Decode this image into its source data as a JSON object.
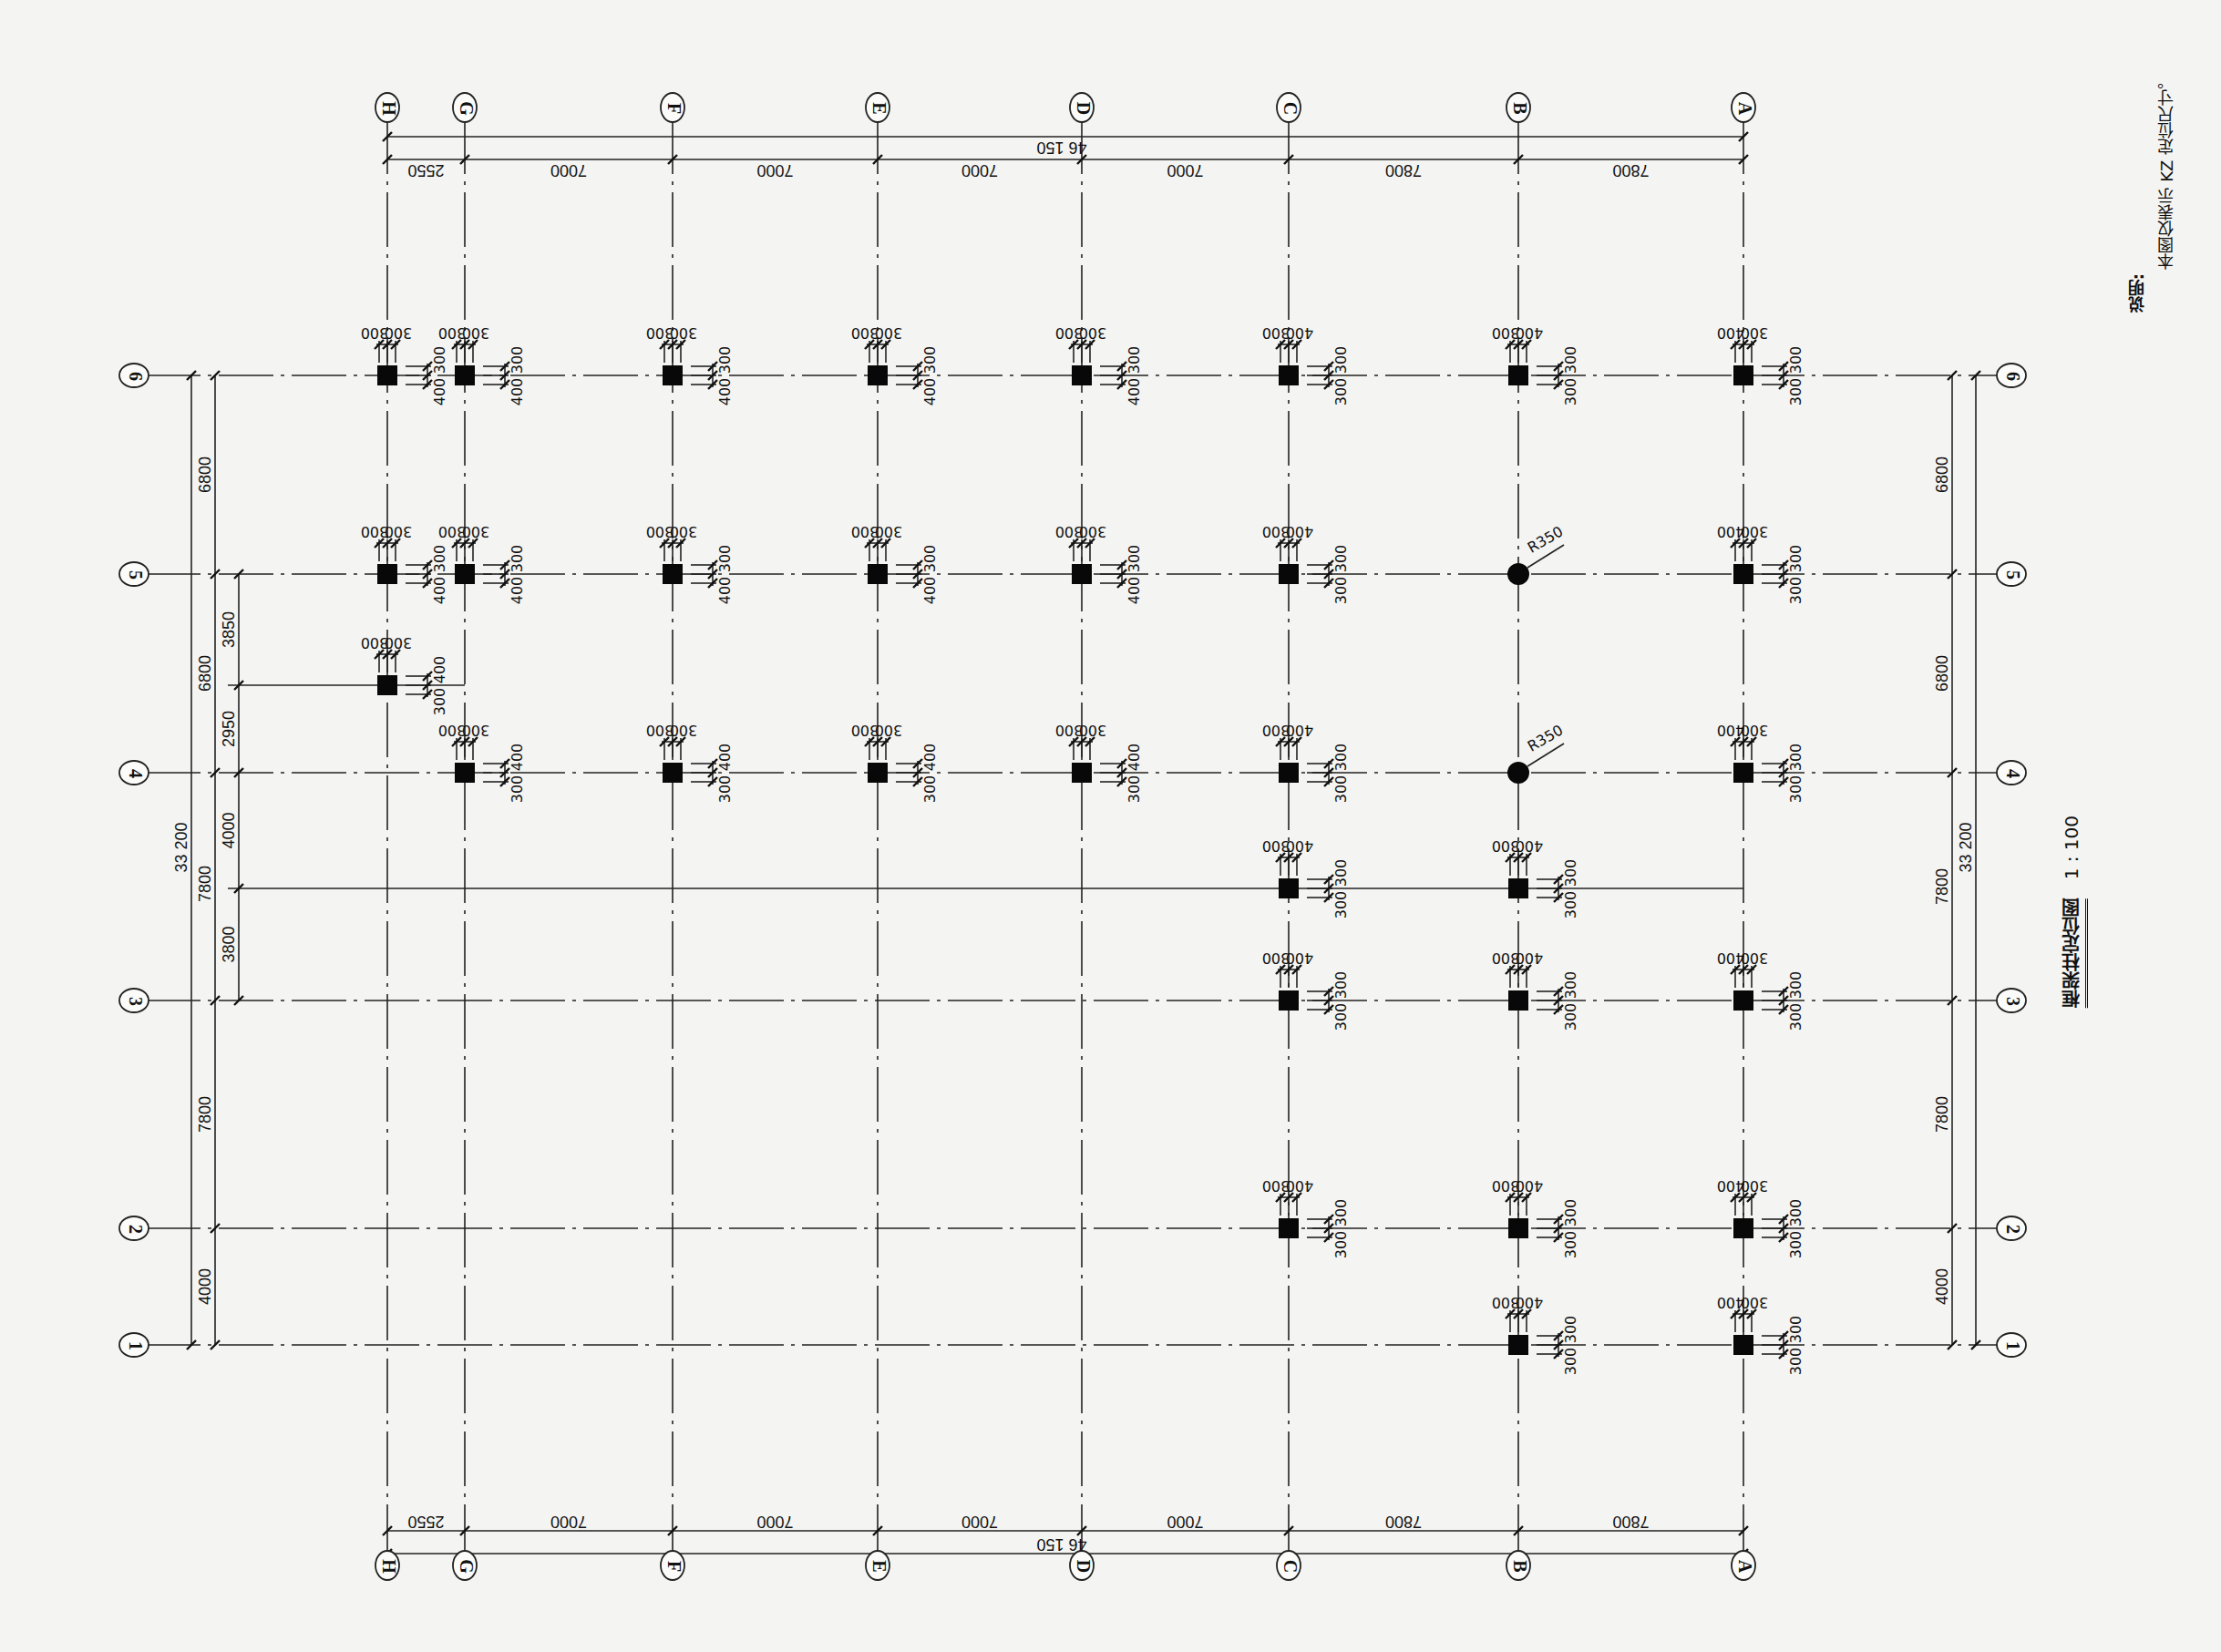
{
  "drawing": {
    "title": "框架柱定位图",
    "scale": "1 : 100",
    "note_heading": "说明:",
    "note_text": "本图仅表示 KZ 定位尺寸。"
  },
  "axes_letter": [
    {
      "label": "H",
      "x": 425
    },
    {
      "label": "G",
      "x": 510
    },
    {
      "label": "F",
      "x": 738
    },
    {
      "label": "E",
      "x": 963
    },
    {
      "label": "D",
      "x": 1187
    },
    {
      "label": "C",
      "x": 1414
    },
    {
      "label": "B",
      "x": 1666
    },
    {
      "label": "A",
      "x": 1913
    }
  ],
  "axes_number": [
    {
      "label": "6",
      "y": 412
    },
    {
      "label": "5",
      "y": 630
    },
    {
      "label": "4",
      "y": 848
    },
    {
      "label": "3",
      "y": 1098
    },
    {
      "label": "2",
      "y": 1348
    },
    {
      "label": "1",
      "y": 1476
    }
  ],
  "extra_lines": [
    {
      "y": 752,
      "x1": 250,
      "x2": 510,
      "note": "between 5 and 4"
    },
    {
      "y": 975,
      "x1": 250,
      "x2": 1913,
      "note": "between 4 and 3"
    }
  ],
  "dims_letter": {
    "segments": [
      "2550",
      "7000",
      "7000",
      "7000",
      "7000",
      "7800",
      "7800"
    ],
    "total": "46 150"
  },
  "dims_number_left": {
    "outer_total": "33 200",
    "middle": [
      "6800",
      "6800",
      "7800",
      "7800",
      "4000"
    ],
    "inner": [
      "3850",
      "2950",
      "4000",
      "3800"
    ]
  },
  "dims_number_right": {
    "outer_total": "33 200",
    "segments": [
      "6800",
      "6800",
      "7800",
      "7800",
      "4000"
    ]
  },
  "columns": [
    {
      "axis": "H6",
      "x": 425,
      "y": 412,
      "shape": "square",
      "top": [
        "300",
        "300"
      ],
      "side": [
        "300",
        "400"
      ]
    },
    {
      "axis": "G6",
      "x": 510,
      "y": 412,
      "shape": "square",
      "top": [
        "300",
        "300"
      ],
      "side": [
        "300",
        "400"
      ]
    },
    {
      "axis": "F6",
      "x": 738,
      "y": 412,
      "shape": "square",
      "top": [
        "300",
        "300"
      ],
      "side": [
        "300",
        "400"
      ]
    },
    {
      "axis": "E6",
      "x": 963,
      "y": 412,
      "shape": "square",
      "top": [
        "300",
        "300"
      ],
      "side": [
        "300",
        "400"
      ]
    },
    {
      "axis": "D6",
      "x": 1187,
      "y": 412,
      "shape": "square",
      "top": [
        "300",
        "300"
      ],
      "side": [
        "300",
        "400"
      ]
    },
    {
      "axis": "C6",
      "x": 1414,
      "y": 412,
      "shape": "square",
      "top": [
        "400",
        "300"
      ],
      "side": [
        "300",
        "300"
      ]
    },
    {
      "axis": "B6",
      "x": 1666,
      "y": 412,
      "shape": "square",
      "top": [
        "400",
        "300"
      ],
      "side": [
        "300",
        "300"
      ]
    },
    {
      "axis": "A6",
      "x": 1913,
      "y": 412,
      "shape": "square",
      "top": [
        "300",
        "400"
      ],
      "side": [
        "300",
        "300"
      ]
    },
    {
      "axis": "H5",
      "x": 425,
      "y": 630,
      "shape": "square",
      "top": [
        "300",
        "300"
      ],
      "side": [
        "300",
        "400"
      ]
    },
    {
      "axis": "G5",
      "x": 510,
      "y": 630,
      "shape": "square",
      "top": [
        "300",
        "300"
      ],
      "side": [
        "300",
        "400"
      ]
    },
    {
      "axis": "F5",
      "x": 738,
      "y": 630,
      "shape": "square",
      "top": [
        "300",
        "300"
      ],
      "side": [
        "300",
        "400"
      ]
    },
    {
      "axis": "E5",
      "x": 963,
      "y": 630,
      "shape": "square",
      "top": [
        "300",
        "300"
      ],
      "side": [
        "300",
        "400"
      ]
    },
    {
      "axis": "D5",
      "x": 1187,
      "y": 630,
      "shape": "square",
      "top": [
        "300",
        "300"
      ],
      "side": [
        "300",
        "400"
      ]
    },
    {
      "axis": "C5",
      "x": 1414,
      "y": 630,
      "shape": "square",
      "top": [
        "400",
        "300"
      ],
      "side": [
        "300",
        "300"
      ]
    },
    {
      "axis": "B5",
      "x": 1666,
      "y": 630,
      "shape": "circle",
      "radius_label": "R350"
    },
    {
      "axis": "A5",
      "x": 1913,
      "y": 630,
      "shape": "square",
      "top": [
        "300",
        "400"
      ],
      "side": [
        "300",
        "300"
      ]
    },
    {
      "axis": "H-5/4",
      "x": 425,
      "y": 752,
      "shape": "square",
      "top": [
        "300",
        "300"
      ],
      "side": [
        "400",
        "300"
      ]
    },
    {
      "axis": "G4",
      "x": 510,
      "y": 848,
      "shape": "square",
      "top": [
        "300",
        "300"
      ],
      "side": [
        "400",
        "300"
      ]
    },
    {
      "axis": "F4",
      "x": 738,
      "y": 848,
      "shape": "square",
      "top": [
        "300",
        "300"
      ],
      "side": [
        "400",
        "300"
      ]
    },
    {
      "axis": "E4",
      "x": 963,
      "y": 848,
      "shape": "square",
      "top": [
        "300",
        "300"
      ],
      "side": [
        "400",
        "300"
      ]
    },
    {
      "axis": "D4",
      "x": 1187,
      "y": 848,
      "shape": "square",
      "top": [
        "300",
        "300"
      ],
      "side": [
        "400",
        "300"
      ]
    },
    {
      "axis": "C4",
      "x": 1414,
      "y": 848,
      "shape": "square",
      "top": [
        "400",
        "300"
      ],
      "side": [
        "300",
        "300"
      ]
    },
    {
      "axis": "B4",
      "x": 1666,
      "y": 848,
      "shape": "circle",
      "radius_label": "R350"
    },
    {
      "axis": "A4",
      "x": 1913,
      "y": 848,
      "shape": "square",
      "top": [
        "300",
        "400"
      ],
      "side": [
        "300",
        "300"
      ]
    },
    {
      "axis": "C-4/3",
      "x": 1414,
      "y": 975,
      "shape": "square",
      "top": [
        "400",
        "300"
      ],
      "side": [
        "300",
        "300"
      ]
    },
    {
      "axis": "B-4/3",
      "x": 1666,
      "y": 975,
      "shape": "square",
      "top": [
        "400",
        "300"
      ],
      "side": [
        "300",
        "300"
      ]
    },
    {
      "axis": "C3",
      "x": 1414,
      "y": 1098,
      "shape": "square",
      "top": [
        "400",
        "300"
      ],
      "side": [
        "300",
        "300"
      ]
    },
    {
      "axis": "B3",
      "x": 1666,
      "y": 1098,
      "shape": "square",
      "top": [
        "400",
        "300"
      ],
      "side": [
        "300",
        "300"
      ]
    },
    {
      "axis": "A3",
      "x": 1913,
      "y": 1098,
      "shape": "square",
      "top": [
        "300",
        "400"
      ],
      "side": [
        "300",
        "300"
      ]
    },
    {
      "axis": "C2",
      "x": 1414,
      "y": 1348,
      "shape": "square",
      "top": [
        "400",
        "300"
      ],
      "side": [
        "300",
        "300"
      ]
    },
    {
      "axis": "B2",
      "x": 1666,
      "y": 1348,
      "shape": "square",
      "top": [
        "400",
        "300"
      ],
      "side": [
        "300",
        "300"
      ]
    },
    {
      "axis": "A2",
      "x": 1913,
      "y": 1348,
      "shape": "square",
      "top": [
        "300",
        "400"
      ],
      "side": [
        "300",
        "300"
      ]
    },
    {
      "axis": "B1",
      "x": 1666,
      "y": 1476,
      "shape": "square",
      "top": [
        "400",
        "300"
      ],
      "side": [
        "300",
        "300"
      ]
    },
    {
      "axis": "A1",
      "x": 1913,
      "y": 1476,
      "shape": "square",
      "top": [
        "300",
        "400"
      ],
      "side": [
        "300",
        "300"
      ]
    }
  ]
}
